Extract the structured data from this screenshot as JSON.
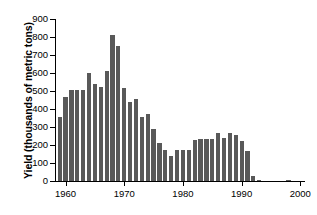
{
  "chart_data": {
    "type": "bar",
    "title": "",
    "xlabel": "",
    "ylabel": "Yield (thousands of metric tons)",
    "ylim": [
      0,
      900
    ],
    "xlim": [
      1958.2,
      2000.8
    ],
    "yticks": [
      0,
      100,
      200,
      300,
      400,
      500,
      600,
      700,
      800,
      900
    ],
    "ytick_labels": [
      "0",
      "100",
      "200",
      "300",
      "400",
      "500",
      "600",
      "700",
      "800",
      "900"
    ],
    "xticks": [
      1960,
      1970,
      1980,
      1990,
      2000
    ],
    "xtick_labels": [
      "1960",
      "1970",
      "1980",
      "1990",
      "2000"
    ],
    "grid": false,
    "legend": null,
    "bar_color": "#595959",
    "axis_color": "#000000",
    "background": "#ffffff",
    "categories": [
      1959,
      1960,
      1961,
      1962,
      1963,
      1964,
      1965,
      1966,
      1967,
      1968,
      1969,
      1970,
      1971,
      1972,
      1973,
      1974,
      1975,
      1976,
      1977,
      1978,
      1979,
      1980,
      1981,
      1982,
      1983,
      1984,
      1985,
      1986,
      1987,
      1988,
      1989,
      1990,
      1991,
      1992,
      1993,
      1994,
      1995,
      1996,
      1997,
      1998,
      1999
    ],
    "values": [
      355,
      465,
      505,
      505,
      505,
      600,
      540,
      520,
      610,
      810,
      750,
      518,
      440,
      455,
      355,
      370,
      288,
      213,
      170,
      140,
      170,
      172,
      172,
      230,
      232,
      233,
      232,
      267,
      240,
      267,
      255,
      220,
      165,
      28,
      7,
      0,
      0,
      0,
      0,
      6,
      0
    ]
  }
}
